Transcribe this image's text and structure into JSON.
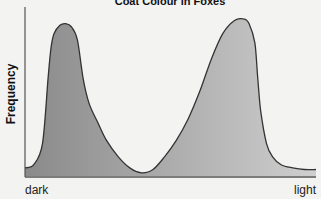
{
  "chart_data": {
    "type": "area",
    "title": "Coat Colour in Foxes",
    "xlabel": "",
    "ylabel": "Frequency",
    "x_tick_labels": [
      "dark",
      "light"
    ],
    "xlim": [
      0,
      1
    ],
    "ylim": [
      0,
      1
    ],
    "grid": false,
    "legend": null,
    "fill_gradient": [
      "#8a8a8a",
      "#cfcfcf"
    ],
    "line_color": "#333333",
    "series": [
      {
        "name": "coat colour distribution",
        "x": [
          0.0,
          0.03,
          0.06,
          0.08,
          0.09,
          0.1,
          0.12,
          0.14,
          0.16,
          0.18,
          0.2,
          0.22,
          0.25,
          0.28,
          0.32,
          0.36,
          0.4,
          0.44,
          0.48,
          0.52,
          0.56,
          0.6,
          0.64,
          0.68,
          0.72,
          0.75,
          0.77,
          0.79,
          0.8,
          0.81,
          0.83,
          0.85,
          0.88,
          0.92,
          0.96,
          1.0
        ],
        "y": [
          0.05,
          0.07,
          0.2,
          0.62,
          0.8,
          0.88,
          0.93,
          0.94,
          0.92,
          0.84,
          0.6,
          0.45,
          0.33,
          0.22,
          0.12,
          0.05,
          0.02,
          0.04,
          0.12,
          0.22,
          0.35,
          0.52,
          0.72,
          0.88,
          0.96,
          0.97,
          0.94,
          0.82,
          0.6,
          0.4,
          0.2,
          0.12,
          0.07,
          0.05,
          0.04,
          0.04
        ]
      }
    ]
  }
}
